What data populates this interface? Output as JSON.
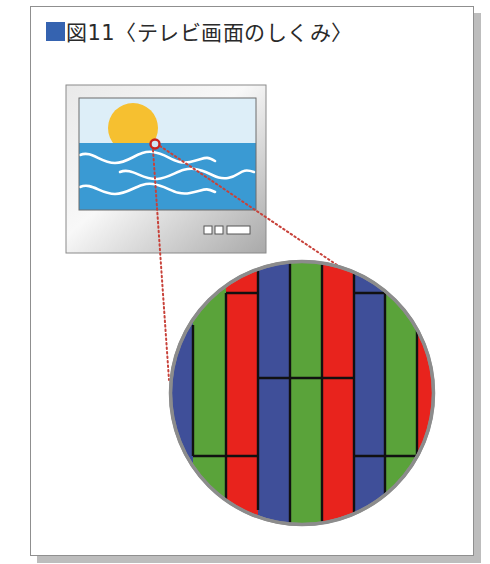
{
  "figure": {
    "title_marker_color": "#3563b0",
    "title": "図11〈テレビ画面のしくみ〉"
  },
  "tv": {
    "label": "television-set",
    "screen_sky_color": "#ddeef8",
    "screen_sea_color": "#3a9ad3",
    "sun_color": "#f6c030",
    "wave_color": "#ffffff",
    "bezel_color": "#c9c9c9",
    "focus_ring_color": "#c8231e",
    "control_buttons": [
      "button-1",
      "button-2",
      "button-wide"
    ]
  },
  "magnifier": {
    "label": "magnified-pixel-view",
    "border_color": "#8c8c8c",
    "leader_line_color": "#c8423a",
    "subpixel_colors": {
      "red": "#e8231d",
      "green": "#5aa33a",
      "blue": "#3f4f99"
    },
    "stripe_order": [
      "blue",
      "green",
      "red",
      "blue",
      "green",
      "red",
      "blue",
      "green",
      "red"
    ]
  }
}
